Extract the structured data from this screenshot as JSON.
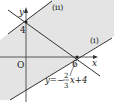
{
  "diagram": {
    "axes": {
      "x_label": "x",
      "y_label": "y",
      "origin_label": "O"
    },
    "ticks": {
      "y_intercept": "4",
      "x_intercept": "6"
    },
    "lines": [
      {
        "id": "ii",
        "label": "(ii)"
      },
      {
        "id": "i",
        "label": "(i)"
      },
      {
        "id": "boundary",
        "equation_prefix": "y=−",
        "frac_num": "2",
        "frac_den": "3",
        "equation_suffix": "x+4"
      }
    ],
    "colors": {
      "shade": "#e4e4e4",
      "line": "#333333"
    }
  }
}
